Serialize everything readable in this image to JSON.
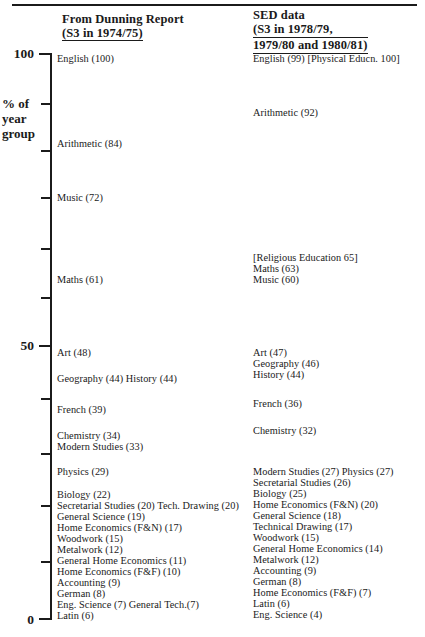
{
  "chart_data": {
    "type": "table",
    "ylabel": "% of year group",
    "ylim": [
      0,
      100
    ],
    "yticks": [
      0,
      50,
      100
    ],
    "ytick_labels": [
      "0",
      "50",
      "100"
    ],
    "grid": false,
    "legend_position": "none",
    "series": [
      {
        "name": "From Dunning Report (S3 in 1974/75)",
        "points": [
          {
            "label": "English (100)",
            "subject": "English",
            "value": 100
          },
          {
            "label": "Arithmetic (84)",
            "subject": "Arithmetic",
            "value": 84
          },
          {
            "label": "Music (72)",
            "subject": "Music",
            "value": 72
          },
          {
            "label": "Maths (61)",
            "subject": "Maths",
            "value": 61
          },
          {
            "label": "Art (48)",
            "subject": "Art",
            "value": 48
          },
          {
            "label": "Geography (44) History (44)",
            "subject": "Geography / History",
            "value": 44
          },
          {
            "label": "French (39)",
            "subject": "French",
            "value": 39
          },
          {
            "label": "Chemistry (34)",
            "subject": "Chemistry",
            "value": 34
          },
          {
            "label": "Modern Studies (33)",
            "subject": "Modern Studies",
            "value": 33
          },
          {
            "label": "Physics (29)",
            "subject": "Physics",
            "value": 29
          },
          {
            "label": "Biology (22)",
            "subject": "Biology",
            "value": 22
          },
          {
            "label": "Secretarial Studies (20) Tech. Drawing (20)",
            "subject": "Secretarial Studies / Tech. Drawing",
            "value": 20
          },
          {
            "label": "General Science (19)",
            "subject": "General Science",
            "value": 19
          },
          {
            "label": "Home Economics (F&N) (17)",
            "subject": "Home Economics (F&N)",
            "value": 17
          },
          {
            "label": "Woodwork (15)",
            "subject": "Woodwork",
            "value": 15
          },
          {
            "label": "Metalwork (12)",
            "subject": "Metalwork",
            "value": 12
          },
          {
            "label": "General Home Economics (11)",
            "subject": "General Home Economics",
            "value": 11
          },
          {
            "label": "Home Economics (F&F) (10)",
            "subject": "Home Economics (F&F)",
            "value": 10
          },
          {
            "label": "Accounting (9)",
            "subject": "Accounting",
            "value": 9
          },
          {
            "label": "German (8)",
            "subject": "German",
            "value": 8
          },
          {
            "label": "Eng. Science (7) General Tech.(7)",
            "subject": "Eng. Science / General Tech.",
            "value": 7
          },
          {
            "label": "Latin (6)",
            "subject": "Latin",
            "value": 6
          }
        ]
      },
      {
        "name": "SED data (S3 in 1978/79, 1979/80 and 1980/81)",
        "points": [
          {
            "label": "English (99) [Physical Educn. 100]",
            "subject": "English / Physical Educn.",
            "value": 99
          },
          {
            "label": "Arithmetic (92)",
            "subject": "Arithmetic",
            "value": 92
          },
          {
            "label": "[Religious Education 65]",
            "subject": "Religious Education",
            "value": 65
          },
          {
            "label": "Maths (63)",
            "subject": "Maths",
            "value": 63
          },
          {
            "label": "Music (60)",
            "subject": "Music",
            "value": 60
          },
          {
            "label": "Art (47)",
            "subject": "Art",
            "value": 47
          },
          {
            "label": "Geography (46)",
            "subject": "Geography",
            "value": 46
          },
          {
            "label": "History (44)",
            "subject": "History",
            "value": 44
          },
          {
            "label": "French (36)",
            "subject": "French",
            "value": 36
          },
          {
            "label": "Chemistry (32)",
            "subject": "Chemistry",
            "value": 32
          },
          {
            "label": "Modern Studies (27) Physics (27)",
            "subject": "Modern Studies / Physics",
            "value": 27
          },
          {
            "label": "Secretarial Studies (26)",
            "subject": "Secretarial Studies",
            "value": 26
          },
          {
            "label": "Biology (25)",
            "subject": "Biology",
            "value": 25
          },
          {
            "label": "Home Economics (F&N) (20)",
            "subject": "Home Economics (F&N)",
            "value": 20
          },
          {
            "label": "General Science (18)",
            "subject": "General Science",
            "value": 18
          },
          {
            "label": "Technical Drawing (17)",
            "subject": "Technical Drawing",
            "value": 17
          },
          {
            "label": "Woodwork (15)",
            "subject": "Woodwork",
            "value": 15
          },
          {
            "label": "General Home Economics (14)",
            "subject": "General Home Economics",
            "value": 14
          },
          {
            "label": "Metalwork (12)",
            "subject": "Metalwork",
            "value": 12
          },
          {
            "label": "Accounting (9)",
            "subject": "Accounting",
            "value": 9
          },
          {
            "label": "German (8)",
            "subject": "German",
            "value": 8
          },
          {
            "label": "Home Economics (F&F) (7)",
            "subject": "Home Economics (F&F)",
            "value": 7
          },
          {
            "label": "Latin (6)",
            "subject": "Latin",
            "value": 6
          },
          {
            "label": "Eng. Science (4)",
            "subject": "Eng. Science",
            "value": 4
          }
        ]
      }
    ]
  },
  "headers": {
    "left": {
      "line1": "From Dunning Report",
      "line2": "(S3 in 1974/75)"
    },
    "right": {
      "line1": "SED data",
      "line2": "(S3 in 1978/79,",
      "line3": "1979/80 and 1980/81)"
    }
  },
  "axis": {
    "caption_line1": "% of",
    "caption_line2": "year",
    "caption_line3": "group",
    "label_100": "100",
    "label_50": "50",
    "label_0": "0"
  },
  "left_labels": [
    "English (100)",
    "Arithmetic (84)",
    "Music (72)",
    "Maths (61)",
    "Art (48)",
    "Geography (44) History (44)",
    "French (39)",
    "Chemistry (34)",
    "Modern Studies (33)",
    "Physics (29)",
    "Biology (22)",
    "Secretarial Studies (20) Tech. Drawing (20)",
    "General Science (19)",
    "Home Economics (F&N) (17)",
    "Woodwork (15)",
    "Metalwork (12)",
    "General Home Economics (11)",
    "Home Economics (F&F) (10)",
    "Accounting (9)",
    "German (8)",
    "Eng. Science (7) General Tech.(7)",
    "Latin (6)"
  ],
  "right_labels": [
    "English (99) [Physical Educn. 100]",
    "Arithmetic (92)",
    "[Religious Education 65]",
    "Maths (63)",
    "Music (60)",
    "Art (47)",
    "Geography (46)",
    "History (44)",
    "French (36)",
    "Chemistry (32)",
    "Modern Studies (27) Physics (27)",
    "Secretarial Studies (26)",
    "Biology (25)",
    "Home Economics (F&N) (20)",
    "General Science (18)",
    "Technical Drawing (17)",
    "Woodwork (15)",
    "General Home Economics (14)",
    "Metalwork (12)",
    "Accounting (9)",
    "German (8)",
    "Home Economics (F&F) (7)",
    "Latin (6)",
    "Eng. Science (4)"
  ],
  "colors": {
    "ink": "#1b1b1b",
    "paper": "#ffffff"
  }
}
